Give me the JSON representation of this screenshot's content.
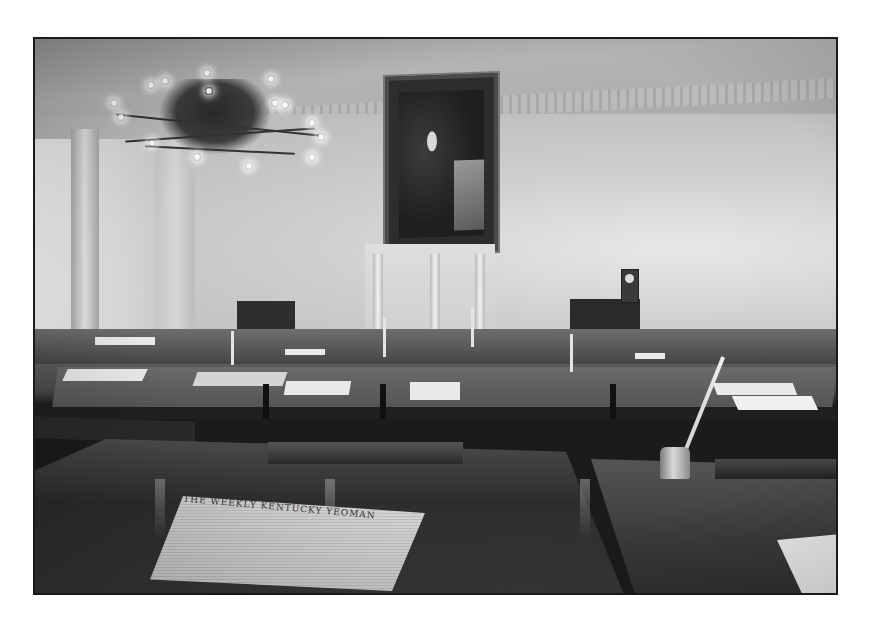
{
  "image": {
    "type": "black-and-white photograph",
    "subject": "Historic legislative chamber interior",
    "elements": {
      "chandelier": "brass chandelier with lit candle bulbs",
      "portrait": "framed portrait of a standing man above the speaker's dais",
      "dais": "white columned mantel / speaker's platform",
      "clock": "small clock atop a dark cabinet",
      "desks": "rows of dark wooden legislator desks with papers, candlesticks and quill inkwells",
      "foreground": "newspaper lying on a polished desk"
    },
    "newspaper_masthead": "THE WEEKLY KENTUCKY YEOMAN"
  }
}
